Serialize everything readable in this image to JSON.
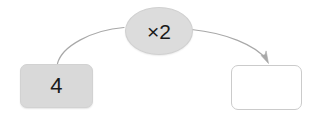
{
  "diagram": {
    "type": "function-machine",
    "background_color": "#ffffff",
    "input_node": {
      "name": "input-box",
      "value": "4",
      "fill_color": "#d9d9d9",
      "border_color": "#d2d2d2",
      "shape": "rounded-rectangle"
    },
    "operator_node": {
      "name": "operator-bubble",
      "label": "×2",
      "fill_color": "#dcdcdc",
      "border_color": "#d0d0d0",
      "shape": "ellipse"
    },
    "output_node": {
      "name": "output-box",
      "value": "",
      "fill_color": "#ffffff",
      "border_color": "#cbcbcb",
      "shape": "rounded-rectangle"
    },
    "connectors": [
      {
        "name": "input-to-operator-curve",
        "from": "input-box",
        "to": "operator-bubble",
        "has_arrowhead": false,
        "stroke_color": "#a8a8a8"
      },
      {
        "name": "operator-to-output-arrow",
        "from": "operator-bubble",
        "to": "output-box",
        "has_arrowhead": true,
        "stroke_color": "#a8a8a8"
      }
    ]
  }
}
